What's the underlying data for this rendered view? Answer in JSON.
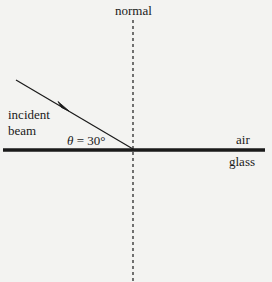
{
  "diagram": {
    "type": "refraction-setup",
    "labels": {
      "normal": "normal",
      "incident_line1": "incident",
      "incident_line2": "beam",
      "theta_symbol": "θ",
      "theta_rest": " = 30°",
      "upper_medium": "air",
      "lower_medium": "glass"
    },
    "angle": {
      "symbol": "θ",
      "value_deg": 30,
      "measured_from": "surface"
    },
    "geometry": {
      "interface_y": 150,
      "interface_x_start": 3,
      "interface_x_end": 265,
      "normal_x": 133,
      "normal_y_start": 20,
      "normal_y_end": 282,
      "beam_start": [
        16,
        80
      ],
      "beam_end": [
        133,
        149
      ]
    },
    "colors": {
      "background": "#f3f3f1",
      "ink": "#1a1a1a"
    }
  }
}
